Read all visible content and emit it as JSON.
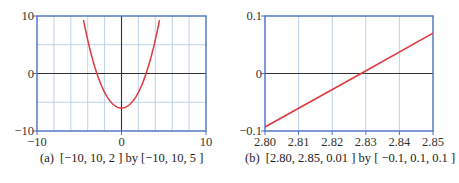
{
  "chart_data": [
    {
      "type": "line",
      "panel": "a",
      "caption": "(a)  [−10, 10, 2 ] by [−10, 10, 5 ]",
      "xlim": [
        -10,
        10
      ],
      "ylim": [
        -10,
        10
      ],
      "xscl": 2,
      "yscl": 5,
      "x_tick_labels": [
        "−10",
        "0",
        "10"
      ],
      "y_tick_labels": [
        "10",
        "0",
        "−10"
      ],
      "grid": true,
      "series": [
        {
          "name": "curve",
          "color": "#e0393e",
          "x": [
            -5.4,
            -4.5,
            -3.5,
            -2.83,
            -2,
            -1,
            0,
            1,
            2,
            2.83,
            3.5,
            4.5,
            5.5
          ],
          "y": [
            10,
            6.5,
            2.6,
            0,
            -2.9,
            -5.2,
            -6,
            -5.2,
            -2.9,
            0,
            2.6,
            6.5,
            10
          ]
        }
      ]
    },
    {
      "type": "line",
      "panel": "b",
      "caption": "(b)  [2.80, 2.85, 0.01 ] by [ −0.1, 0.1, 0.1 ]",
      "xlim": [
        2.8,
        2.85
      ],
      "ylim": [
        -0.1,
        0.1
      ],
      "xscl": 0.01,
      "yscl": 0.1,
      "x_tick_labels": [
        "2.80",
        "2.81",
        "2.82",
        "2.83",
        "2.84",
        "2.85"
      ],
      "y_tick_labels": [
        "0.1",
        "0",
        "−0.1"
      ],
      "grid": true,
      "series": [
        {
          "name": "curve",
          "color": "#e0393e",
          "x": [
            2.8,
            2.8286,
            2.85
          ],
          "y": [
            -0.093,
            0.0,
            0.07
          ]
        }
      ]
    }
  ],
  "colors": {
    "frame": "#4a6fc2",
    "grid": "#bcd3ec",
    "axis": "#333333",
    "curve": "#e0393e"
  }
}
